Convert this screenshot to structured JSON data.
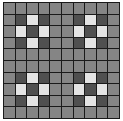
{
  "board": {
    "rows": 10,
    "cols": 10,
    "palette": {
      "M": "#858585",
      "D": "#505050",
      "L": "#e4e4e4"
    },
    "cells": [
      [
        "M",
        "M",
        "M",
        "M",
        "M",
        "M",
        "M",
        "M",
        "M",
        "M"
      ],
      [
        "M",
        "D",
        "L",
        "D",
        "M",
        "M",
        "D",
        "L",
        "D",
        "M"
      ],
      [
        "M",
        "L",
        "D",
        "L",
        "M",
        "M",
        "L",
        "D",
        "L",
        "M"
      ],
      [
        "M",
        "D",
        "L",
        "D",
        "M",
        "M",
        "D",
        "L",
        "D",
        "M"
      ],
      [
        "M",
        "M",
        "M",
        "M",
        "M",
        "M",
        "M",
        "M",
        "M",
        "M"
      ],
      [
        "M",
        "M",
        "M",
        "M",
        "M",
        "M",
        "M",
        "M",
        "M",
        "M"
      ],
      [
        "M",
        "D",
        "L",
        "D",
        "M",
        "M",
        "D",
        "L",
        "D",
        "M"
      ],
      [
        "M",
        "L",
        "D",
        "L",
        "M",
        "M",
        "L",
        "D",
        "L",
        "M"
      ],
      [
        "M",
        "D",
        "L",
        "D",
        "M",
        "M",
        "D",
        "L",
        "D",
        "M"
      ],
      [
        "M",
        "M",
        "M",
        "M",
        "M",
        "M",
        "M",
        "M",
        "M",
        "M"
      ]
    ]
  }
}
